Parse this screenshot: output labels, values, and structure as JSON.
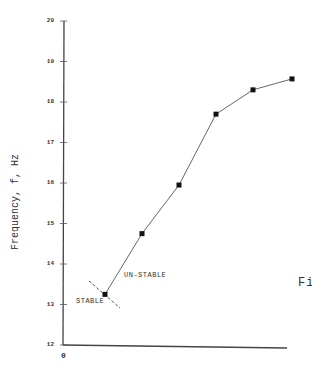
{
  "chart_data": {
    "type": "line",
    "title": "",
    "xlabel": "",
    "ylabel": "Frequency, f, Hz",
    "ylim": [
      12,
      20
    ],
    "yticks": [
      "12",
      "13",
      "14",
      "15",
      "16",
      "17",
      "18",
      "19",
      "20"
    ],
    "x_origin_label": "0",
    "grid": false,
    "legend": null,
    "series": [
      {
        "name": "frequency",
        "marker": "square",
        "x_px": [
          105,
          142,
          179,
          216,
          253,
          292
        ],
        "values": [
          13.25,
          14.75,
          15.95,
          17.7,
          18.3,
          18.57
        ]
      }
    ],
    "annotations": [
      {
        "text": "STABLE",
        "position": "left of boundary"
      },
      {
        "text": "UN-STABLE",
        "position": "right of boundary"
      }
    ],
    "boundary": {
      "style": "dashed",
      "from_px": [
        89,
        281
      ],
      "to_px": [
        120,
        308
      ]
    },
    "figure_label_partial": "Fi"
  },
  "labels": {
    "ylabel": "Frequency, f, Hz",
    "stable": "STABLE",
    "unstable": "UN-STABLE",
    "fig": "Fi",
    "origin": "0"
  }
}
